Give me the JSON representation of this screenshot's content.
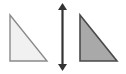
{
  "figure": {
    "canvas": {
      "width": 126,
      "height": 74,
      "background_color": "#ffffff"
    },
    "shapes": [
      {
        "name": "left-triangle",
        "label": "",
        "type": "right-triangle",
        "fill_color": "#f1f1f1",
        "stroke_color": "#8a8a8a",
        "stroke_width": 1.4,
        "right_angle_corner": "bottom-left",
        "points": "10,15 10,61 47,61",
        "apex": {
          "x": 10,
          "y": 15
        },
        "right_angle": {
          "x": 10,
          "y": 61
        },
        "far_corner": {
          "x": 47,
          "y": 61
        }
      },
      {
        "name": "right-triangle",
        "label": "",
        "type": "right-triangle",
        "fill_color": "#a9a9a9",
        "stroke_color": "#4a4a4a",
        "stroke_width": 1.6,
        "right_angle_corner": "bottom-left",
        "points": "80,15 80,61 117,61",
        "apex": {
          "x": 80,
          "y": 15
        },
        "right_angle": {
          "x": 80,
          "y": 61
        },
        "far_corner": {
          "x": 117,
          "y": 61
        }
      }
    ],
    "arrow": {
      "name": "vertical-double-arrow",
      "orientation": "vertical",
      "double_headed": true,
      "color": "#333333",
      "shaft_x": 62.5,
      "top_y": 3,
      "bottom_y": 71,
      "shaft_width": 2.2,
      "head_half_width": 4.5,
      "head_length": 7
    }
  }
}
